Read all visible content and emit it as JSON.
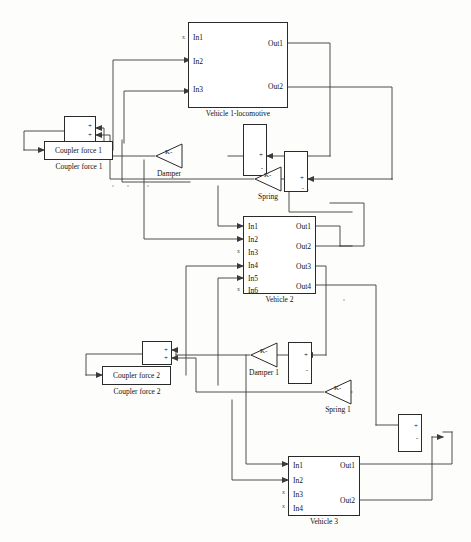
{
  "diagram": {
    "line_color": "#3a3a3a",
    "block_border_color": "#2a2a2a",
    "background": "#fdfdfc"
  },
  "subsystems": [
    {
      "id": "vehicle1",
      "caption": "Vehicle 1-locomotive",
      "inputs": [
        "In1",
        "In2",
        "In3"
      ],
      "outputs": [
        "Out1",
        "Out2"
      ],
      "unconnected_inputs": [
        "In1"
      ]
    },
    {
      "id": "vehicle2",
      "caption": "Vehicle 2",
      "inputs": [
        "In1",
        "In2",
        "In3",
        "In4",
        "In5",
        "In6"
      ],
      "outputs": [
        "Out1",
        "Out2",
        "Out3",
        "Out4"
      ],
      "unconnected_inputs": [
        "In3",
        "In6"
      ]
    },
    {
      "id": "vehicle3",
      "caption": "Vehicle 3",
      "inputs": [
        "In1",
        "In2",
        "In3",
        "In4"
      ],
      "outputs": [
        "Out1",
        "Out2"
      ],
      "unconnected_inputs": [
        "In3",
        "In4"
      ]
    }
  ],
  "coupler_blocks": [
    {
      "id": "coupler1",
      "text": "Coupler force 1",
      "caption": "Coupler force 1"
    },
    {
      "id": "coupler2",
      "text": "Coupler force 2",
      "caption": "Coupler force 2"
    }
  ],
  "gains": [
    {
      "id": "damper",
      "label": "Damper",
      "k": "K-"
    },
    {
      "id": "spring",
      "label": "Spring",
      "k": "K-"
    },
    {
      "id": "damper1",
      "label": "Damper 1",
      "k": "K-"
    },
    {
      "id": "spring1",
      "label": "Spring 1",
      "k": "K-"
    }
  ],
  "sum_blocks": [
    {
      "id": "sum_coupler1",
      "signs": [
        "+",
        "+"
      ]
    },
    {
      "id": "sum_damper",
      "signs": [
        "+",
        "-"
      ]
    },
    {
      "id": "sum_spring",
      "signs": [
        "+",
        "-"
      ]
    },
    {
      "id": "sum_coupler2",
      "signs": [
        "+",
        "+"
      ]
    },
    {
      "id": "sum_damper1",
      "signs": [
        "+",
        "-"
      ]
    },
    {
      "id": "sum_spring1",
      "signs": [
        "+",
        "-"
      ]
    }
  ],
  "unconnected_marker": "x"
}
